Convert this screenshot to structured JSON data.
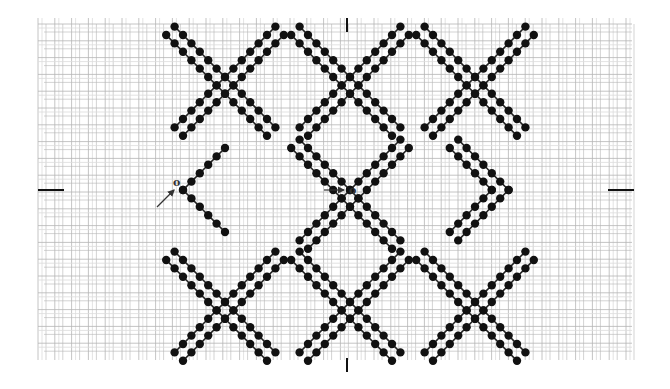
{
  "diagram": {
    "type": "needlework stitch chart",
    "canvas": {
      "x0": 38,
      "y0": 18,
      "x1": 632,
      "y1": 360,
      "cell": 8.4,
      "thread_color": "#b5b5b5",
      "thread_color_light": "#dcdcdc"
    },
    "stitch": {
      "dot_color": "#111111",
      "line_color": "#222222",
      "dot_radius": 4.2,
      "step": 8.4
    },
    "motifs": {
      "columns": [
        225,
        350,
        475
      ],
      "rows": [
        77,
        190,
        302
      ],
      "arm_steps": 6,
      "description": "Interlaced double-line X motifs arranged in a diamond lattice"
    },
    "labels": {
      "start_left": "o",
      "start_center": "o"
    },
    "markers": {
      "left_tick": {
        "x1": 38,
        "x2": 64,
        "y": 190
      },
      "right_tick": {
        "x1": 608,
        "x2": 634,
        "y": 190
      },
      "top_tick": {
        "x": 347,
        "y1": 18,
        "y2": 32
      },
      "bottom_tick": {
        "x": 347,
        "y1": 358,
        "y2": 372
      },
      "arrow_left": {
        "x1": 157,
        "y1": 207,
        "x2": 174,
        "y2": 190
      },
      "arrow_center": {
        "x1": 324,
        "y1": 190,
        "x2": 344,
        "y2": 190
      }
    }
  }
}
